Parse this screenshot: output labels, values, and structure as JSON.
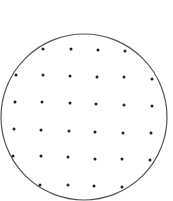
{
  "diagram": {
    "circle": {
      "cx": 84,
      "cy": 117,
      "r": 83,
      "stroke": "#555555"
    },
    "dot_color": "#222222",
    "dot_radius": 1.5,
    "dots": [
      [
        43,
        49
      ],
      [
        71,
        49
      ],
      [
        98,
        50
      ],
      [
        125,
        51
      ],
      [
        16,
        75
      ],
      [
        43,
        75
      ],
      [
        70,
        76
      ],
      [
        97,
        77
      ],
      [
        124,
        77
      ],
      [
        152,
        79
      ],
      [
        15,
        102
      ],
      [
        42,
        102
      ],
      [
        70,
        103
      ],
      [
        96,
        104
      ],
      [
        124,
        105
      ],
      [
        152,
        106
      ],
      [
        14,
        129
      ],
      [
        41,
        130
      ],
      [
        69,
        131
      ],
      [
        95,
        132
      ],
      [
        123,
        133
      ],
      [
        151,
        133
      ],
      [
        13,
        156
      ],
      [
        41,
        156
      ],
      [
        68,
        157
      ],
      [
        95,
        159
      ],
      [
        122,
        159
      ],
      [
        150,
        160
      ],
      [
        40,
        185
      ],
      [
        68,
        185
      ],
      [
        94,
        186
      ],
      [
        122,
        187
      ]
    ]
  }
}
